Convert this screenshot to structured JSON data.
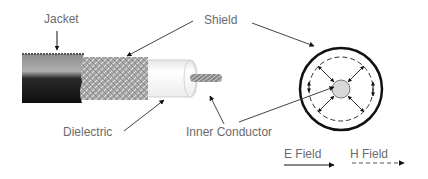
{
  "diagram": {
    "labels": {
      "jacket": "Jacket",
      "shield": "Shield",
      "dielectric": "Dielectric",
      "inner_conductor": "Inner Conductor"
    },
    "legend": {
      "e_field": "E Field",
      "h_field": "H Field"
    },
    "colors": {
      "label_text": "#6b6b6b",
      "line": "#111111",
      "jacket_dark": "#151515",
      "jacket_light": "#9a9a9a",
      "shield_braid": "#a8a8a8",
      "dielectric": "#f6f6f6",
      "conductor": "#d8d8d8"
    }
  }
}
